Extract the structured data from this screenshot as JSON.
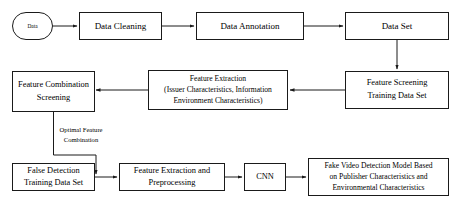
{
  "diagram": {
    "background_color": "#ffffff",
    "line_color": "#1a1a1a",
    "box_fill": "#ffffff",
    "nodes": {
      "data": {
        "label": "Data",
        "shape": "stadium"
      },
      "data_cleaning": {
        "label": "Data Cleaning",
        "shape": "rect"
      },
      "data_annotation": {
        "label": "Data Annotation",
        "shape": "rect"
      },
      "data_set": {
        "label": "Data Set",
        "shape": "rect"
      },
      "feature_screening_training_data_set": {
        "line1": "Feature Screening",
        "line2": "Training Data Set",
        "shape": "rect"
      },
      "feature_extraction": {
        "line1": "Feature Extraction",
        "line2": "(Issuer Characteristics, Information",
        "line3": "Environment Characteristics)",
        "shape": "rect"
      },
      "feature_combination_screening": {
        "line1": "Feature Combination",
        "line2": "Screening",
        "shape": "rect"
      },
      "false_detection_training_data_set": {
        "line1": "False Detection",
        "line2": "Training Data Set",
        "shape": "rect"
      },
      "feature_extraction_and_preprocessing": {
        "line1": "Feature Extraction and",
        "line2": "Preprocessing",
        "shape": "rect"
      },
      "cnn": {
        "label": "CNN",
        "shape": "rect"
      },
      "fake_video_detection_model": {
        "line1": "Fake Video Detection Model Based",
        "line2": "on Publisher Characteristics and",
        "line3": "Environmental Characteristics",
        "shape": "rect"
      }
    },
    "edge_labels": {
      "optimal_feature_combination_line1": "Optimal Feature",
      "optimal_feature_combination_line2": "Combination"
    }
  }
}
